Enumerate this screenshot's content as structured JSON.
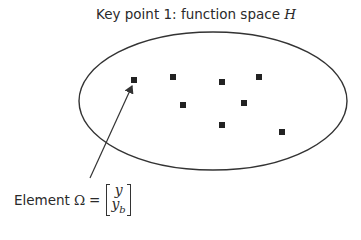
{
  "title": {
    "prefix": "Key point 1: function space ",
    "symbol": "H"
  },
  "label": {
    "text": "Element",
    "symbol": "Ω",
    "equals": "=",
    "vector": [
      "y",
      "y",
      "b"
    ]
  },
  "diagram": {
    "ellipse": {
      "cx": 213,
      "cy": 101,
      "rx": 134,
      "ry": 69
    },
    "points": [
      [
        134,
        80
      ],
      [
        173,
        77
      ],
      [
        222,
        82
      ],
      [
        259,
        77
      ],
      [
        183,
        105
      ],
      [
        244,
        103
      ],
      [
        222,
        125
      ],
      [
        282,
        132
      ]
    ],
    "arrow": {
      "from": [
        90,
        178
      ],
      "to": [
        132,
        86
      ]
    }
  }
}
